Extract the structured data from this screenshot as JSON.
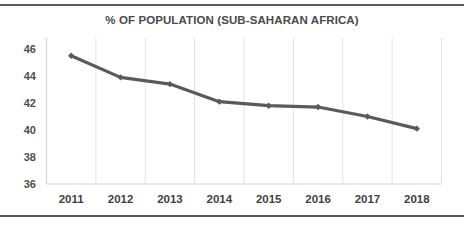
{
  "chart_data": {
    "type": "line",
    "title": "% OF POPULATION (SUB-SAHARAN AFRICA)",
    "xlabel": "",
    "ylabel": "",
    "categories": [
      "2011",
      "2012",
      "2013",
      "2014",
      "2015",
      "2016",
      "2017",
      "2018"
    ],
    "values": [
      45.5,
      43.9,
      43.4,
      42.1,
      41.8,
      41.7,
      41.0,
      40.1
    ],
    "series": [
      {
        "name": "% of population",
        "values": [
          45.5,
          43.9,
          43.4,
          42.1,
          41.8,
          41.7,
          41.0,
          40.1
        ]
      }
    ],
    "ylim": [
      36,
      46
    ],
    "yticks": [
      36,
      38,
      40,
      42,
      44,
      46
    ],
    "ytick_labels": [
      "36",
      "38",
      "40",
      "42",
      "44",
      "46"
    ],
    "xtick_labels": [
      "2011",
      "2012",
      "2013",
      "2014",
      "2015",
      "2016",
      "2017",
      "2018"
    ],
    "grid": "vertical",
    "legend": "none",
    "line_color": "#5a5a5a",
    "marker": "diamond",
    "axis_color": "#d6d6d6",
    "gridline_color": "#e2e2e2",
    "title_color": "#4a4a4a",
    "tick_color": "#4f4f4f",
    "background": "#ffffff",
    "border_color": "#5b5b5b"
  }
}
